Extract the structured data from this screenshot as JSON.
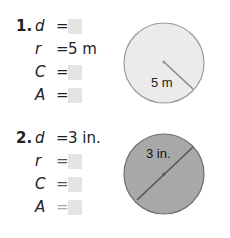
{
  "problems": [
    {
      "number": "1.",
      "rows": [
        {
          "var": "d",
          "eq": "=",
          "value": null
        },
        {
          "var": "r",
          "eq": "=",
          "value": "5 m"
        },
        {
          "var": "C",
          "eq": "=",
          "value": null
        },
        {
          "var": "A",
          "eq": "=",
          "value": null
        }
      ],
      "figure": {
        "type": "circle",
        "label": "5 m",
        "segment": "radius",
        "fill": "#ebebeb",
        "stroke": "#9a9a9a"
      }
    },
    {
      "number": "2.",
      "rows": [
        {
          "var": "d",
          "eq": "=",
          "value": "3 in."
        },
        {
          "var": "r",
          "eq": "=",
          "value": null
        },
        {
          "var": "C",
          "eq": "=",
          "value": null
        },
        {
          "var": "A",
          "eq": "=",
          "value": null
        }
      ],
      "figure": {
        "type": "circle",
        "label": "3 in.",
        "segment": "diameter",
        "fill": "#a8a8a8",
        "stroke": "#6f6f6f"
      }
    }
  ]
}
